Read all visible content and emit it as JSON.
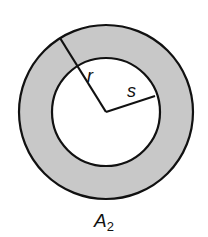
{
  "diagram": {
    "labels": {
      "outer_radius": "r",
      "inner_radius": "s",
      "area_main": "A",
      "area_sub": "2"
    },
    "colors": {
      "ring_fill": "#c8c8c8",
      "stroke": "#111111",
      "background": "#ffffff"
    },
    "geometry": {
      "center": [
        106,
        112
      ],
      "outer_radius_px": 87,
      "inner_radius_px": 54
    }
  }
}
